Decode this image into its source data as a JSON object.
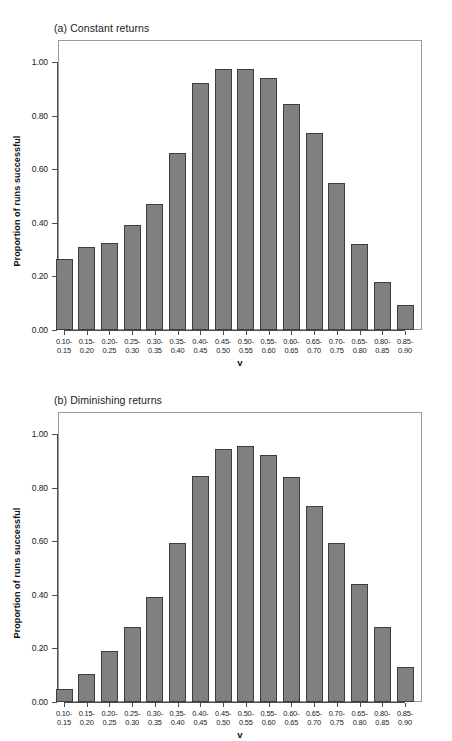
{
  "figure": {
    "x_axis_label": "v",
    "y_axis_label": "Proportion of runs successful",
    "y_ticks": [
      "0.00",
      "0.20",
      "0.40",
      "0.60",
      "0.80",
      "1.00"
    ],
    "bar_color": "#808080",
    "bar_border_color": "#3d3d3d",
    "frame_color": "#9a9a9a"
  },
  "chart_data": [
    {
      "type": "bar",
      "title": "(a) Constant returns",
      "panel": "a",
      "xlabel": "v",
      "ylabel": "Proportion of runs successful",
      "ylim": [
        0.0,
        1.05
      ],
      "yticks": [
        0.0,
        0.2,
        0.4,
        0.6,
        0.8,
        1.0
      ],
      "grid": false,
      "legend": null,
      "categories": [
        "0.10-\n0.15",
        "0.15-\n0.20",
        "0.20-\n0.25",
        "0.25-\n0.30",
        "0.30-\n0.35",
        "0.35-\n0.40",
        "0.40-\n0.45",
        "0.45-\n0.50",
        "0.50-\n0.55",
        "0.55-\n0.60",
        "0.60-\n0.65",
        "0.65-\n0.70",
        "0.70-\n0.75",
        "0.65-\n0.80",
        "0.80-\n0.85",
        "0.85-\n0.90"
      ],
      "categories_line1": [
        "0.10-",
        "0.15-",
        "0.20-",
        "0.25-",
        "0.30-",
        "0.35-",
        "0.40-",
        "0.45-",
        "0.50-",
        "0.55-",
        "0.60-",
        "0.65-",
        "0.70-",
        "0.65-",
        "0.80-",
        "0.85-"
      ],
      "categories_line2": [
        "0.15",
        "0.20",
        "0.25",
        "0.30",
        "0.35",
        "0.40",
        "0.45",
        "0.50",
        "0.55",
        "0.60",
        "0.65",
        "0.70",
        "0.75",
        "0.80",
        "0.85",
        "0.90"
      ],
      "values": [
        0.265,
        0.31,
        0.325,
        0.39,
        0.47,
        0.66,
        0.92,
        0.975,
        0.975,
        0.94,
        0.845,
        0.735,
        0.55,
        0.32,
        0.18,
        0.095
      ]
    },
    {
      "type": "bar",
      "title": "(b) Diminishing returns",
      "panel": "b",
      "xlabel": "v",
      "ylabel": "Proportion of runs successful",
      "ylim": [
        0.0,
        1.05
      ],
      "yticks": [
        0.0,
        0.2,
        0.4,
        0.6,
        0.8,
        1.0
      ],
      "grid": false,
      "legend": null,
      "categories": [
        "0.10-\n0.15",
        "0.15-\n0.20",
        "0.20-\n0.25",
        "0.25-\n0.30",
        "0.30-\n0.35",
        "0.35-\n0.40",
        "0.40-\n0.45",
        "0.45-\n0.50",
        "0.50-\n0.55",
        "0.55-\n0.60",
        "0.60-\n0.65",
        "0.65-\n0.70",
        "0.70-\n0.75",
        "0.65-\n0.80",
        "0.80-\n0.85",
        "0.85-\n0.90"
      ],
      "categories_line1": [
        "0.10-",
        "0.15-",
        "0.20-",
        "0.25-",
        "0.30-",
        "0.35-",
        "0.40-",
        "0.45-",
        "0.50-",
        "0.55-",
        "0.60-",
        "0.65-",
        "0.70-",
        "0.65-",
        "0.80-",
        "0.85-"
      ],
      "categories_line2": [
        "0.15",
        "0.20",
        "0.25",
        "0.30",
        "0.35",
        "0.40",
        "0.45",
        "0.50",
        "0.55",
        "0.60",
        "0.65",
        "0.70",
        "0.75",
        "0.80",
        "0.85",
        "0.90"
      ],
      "values": [
        0.05,
        0.105,
        0.19,
        0.28,
        0.39,
        0.595,
        0.845,
        0.945,
        0.955,
        0.92,
        0.84,
        0.73,
        0.595,
        0.44,
        0.28,
        0.13
      ]
    }
  ]
}
